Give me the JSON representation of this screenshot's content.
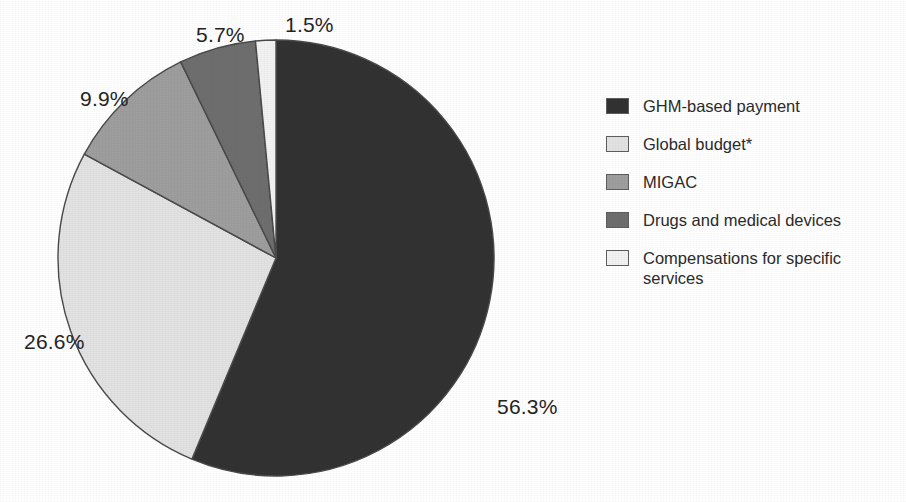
{
  "chart_data": {
    "type": "pie",
    "title": "",
    "subtitle": "",
    "xlabel": "",
    "ylabel": "",
    "legend_position": "right",
    "grid": false,
    "unit": "%",
    "start_angle_deg": 0,
    "direction": "clockwise",
    "categories": [
      "GHM-based payment",
      "Global budget*",
      "MIGAC",
      "Drugs and medical devices",
      "Compensations for specific services"
    ],
    "values": [
      56.3,
      26.6,
      9.9,
      5.7,
      1.5
    ],
    "labels": [
      "56.3%",
      "26.6%",
      "9.9%",
      "5.7%",
      "1.5%"
    ],
    "colors": [
      "#323232",
      "#e2e2e2",
      "#9e9e9e",
      "#6e6e6e",
      "#f2f2f2"
    ],
    "slices": [
      {
        "label": "GHM-based payment",
        "value": 56.3,
        "display": "56.3%",
        "color": "#323232"
      },
      {
        "label": "Global budget*",
        "value": 26.6,
        "display": "26.6%",
        "color": "#e2e2e2"
      },
      {
        "label": "MIGAC",
        "value": 9.9,
        "display": "9.9%",
        "color": "#9e9e9e"
      },
      {
        "label": "Drugs and medical devices",
        "value": 5.7,
        "display": "5.7%",
        "color": "#6e6e6e"
      },
      {
        "label": "Compensations for specific services",
        "value": 1.5,
        "display": "1.5%",
        "color": "#f2f2f2"
      }
    ]
  },
  "pie": {
    "center_x": 276,
    "center_y": 258,
    "radius": 218,
    "outline_color": "#4a4a4a"
  },
  "legend": {
    "items": [
      {
        "label": "GHM-based payment",
        "color": "#323232"
      },
      {
        "label": "Global budget*",
        "color": "#e2e2e2"
      },
      {
        "label": "MIGAC",
        "color": "#9e9e9e"
      },
      {
        "label": "Drugs and medical devices",
        "color": "#6e6e6e"
      },
      {
        "label": "Compensations for specific services",
        "color": "#f2f2f2"
      }
    ]
  }
}
